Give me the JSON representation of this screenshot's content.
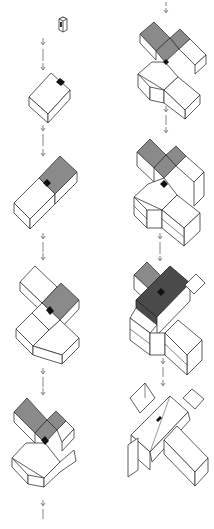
{
  "diagram": {
    "title": "",
    "type": "isometric building massing sequence",
    "layout": "two columns, top-to-bottom steps connected by dashed down-arrows",
    "colors": {
      "line": "#333333",
      "fill_white": "#ffffff",
      "highlight_gray": "#8a8a8a",
      "highlight_dark": "#4a4a4a",
      "core_black": "#111111",
      "arrow": "#666666"
    },
    "columns": [
      {
        "name": "left",
        "steps": [
          {
            "index": 1,
            "description": "small vertical core element"
          },
          {
            "index": 2,
            "description": "single rectangular block with core on top"
          },
          {
            "index": 3,
            "description": "elongated block with gray highlighted half"
          },
          {
            "index": 4,
            "description": "cross-shaped plan with gray highlighted wing"
          },
          {
            "index": 5,
            "description": "cross plan with gray highlighted upper wings"
          }
        ]
      },
      {
        "name": "right",
        "steps": [
          {
            "index": 6,
            "description": "cross plan, stacked floors, gray wings"
          },
          {
            "index": 7,
            "description": "cross plan with additional floor levels"
          },
          {
            "index": 8,
            "description": "multi-storey cross with dark highlighted wing"
          },
          {
            "index": 9,
            "description": "final building with hipped roofs"
          }
        ]
      }
    ],
    "labels": []
  }
}
